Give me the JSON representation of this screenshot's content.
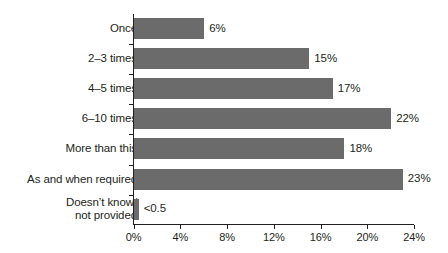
{
  "chart_data": {
    "type": "bar",
    "orientation": "horizontal",
    "title": "",
    "xlabel": "",
    "ylabel": "",
    "xlim": [
      0,
      24
    ],
    "xticks": [
      "0%",
      "4%",
      "8%",
      "12%",
      "16%",
      "20%",
      "24%"
    ],
    "xtick_values": [
      0,
      4,
      8,
      12,
      16,
      20,
      24
    ],
    "grid": false,
    "legend": false,
    "bar_color": "#6b6b6b",
    "categories": [
      "Once",
      "2–3 times",
      "4–5 times",
      "6–10 times",
      "More than this",
      "As and when required",
      "Doesn’t know/\nnot provided"
    ],
    "values": [
      6,
      15,
      17,
      22,
      18,
      23,
      0.4
    ],
    "data_labels": [
      "6%",
      "15%",
      "17%",
      "22%",
      "18%",
      "23%",
      "<0.5"
    ]
  },
  "chart": {
    "bars": [
      {
        "label": "Once",
        "label_line1": "Once",
        "label_line2": "",
        "value": 6,
        "value_label": "6%"
      },
      {
        "label": "2–3 times",
        "label_line1": "2–3 times",
        "label_line2": "",
        "value": 15,
        "value_label": "15%"
      },
      {
        "label": "4–5 times",
        "label_line1": "4–5 times",
        "label_line2": "",
        "value": 17,
        "value_label": "17%"
      },
      {
        "label": "6–10 times",
        "label_line1": "6–10 times",
        "label_line2": "",
        "value": 22,
        "value_label": "22%"
      },
      {
        "label": "More than this",
        "label_line1": "More than this",
        "label_line2": "",
        "value": 18,
        "value_label": "18%"
      },
      {
        "label": "As and when required",
        "label_line1": "As and when required",
        "label_line2": "",
        "value": 23,
        "value_label": "23%"
      },
      {
        "label": "Doesn’t know/ not provided",
        "label_line1": "Doesn’t know/",
        "label_line2": "not provided",
        "value": 0.4,
        "value_label": "<0.5"
      }
    ],
    "axis": {
      "ticks": [
        {
          "label": "0%",
          "value": 0
        },
        {
          "label": "4%",
          "value": 4
        },
        {
          "label": "8%",
          "value": 8
        },
        {
          "label": "12%",
          "value": 12
        },
        {
          "label": "16%",
          "value": 16
        },
        {
          "label": "20%",
          "value": 20
        },
        {
          "label": "24%",
          "value": 24
        }
      ]
    }
  }
}
